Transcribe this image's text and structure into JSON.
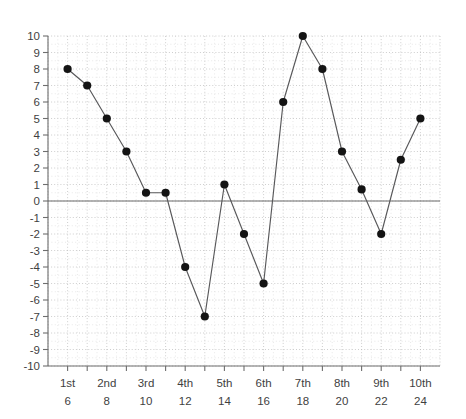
{
  "chart_data": {
    "type": "line",
    "title": "",
    "subtitle": "",
    "xlabel": "",
    "ylabel": "",
    "x": [
      6,
      7,
      8,
      9,
      10,
      11,
      12,
      13,
      14,
      15,
      16,
      17,
      18,
      19,
      20,
      21,
      22,
      23,
      24
    ],
    "values": [
      8,
      7,
      5,
      3,
      0.5,
      0.5,
      -4,
      -7,
      1,
      -2,
      -5,
      6,
      10,
      8,
      3,
      0.7,
      -2,
      2.5,
      5
    ],
    "series": [
      {
        "name": "",
        "values": [
          8,
          7,
          5,
          3,
          0.5,
          0.5,
          -4,
          -7,
          1,
          -2,
          -5,
          6,
          10,
          8,
          3,
          0.7,
          -2,
          2.5,
          5
        ]
      }
    ],
    "xlim": [
      5,
      25
    ],
    "ylim": [
      -10,
      10
    ],
    "y_ticks": [
      10,
      9,
      8,
      7,
      6,
      5,
      4,
      3,
      2,
      1,
      0,
      -1,
      -2,
      -3,
      -4,
      -5,
      -6,
      -7,
      -8,
      -9,
      -10
    ],
    "y_tick_labels": [
      "10",
      "9",
      "8",
      "7",
      "6",
      "5",
      "4",
      "3",
      "2",
      "1",
      "0",
      "-1",
      "-2",
      "-3",
      "-4",
      "-5",
      "-6",
      "-7",
      "-8",
      "-9",
      "-10"
    ],
    "x_ticks": [
      6,
      7,
      8,
      9,
      10,
      11,
      12,
      13,
      14,
      15,
      16,
      17,
      18,
      19,
      20,
      21,
      22,
      23,
      24
    ],
    "x_labeled_ticks": [
      6,
      8,
      10,
      12,
      14,
      16,
      18,
      20,
      22,
      24
    ],
    "x_tick_labels_ordinal": [
      "1st",
      "2nd",
      "3rd",
      "4th",
      "5th",
      "6th",
      "7th",
      "8th",
      "9th",
      "10th"
    ],
    "x_tick_labels_numeric": [
      "6",
      "8",
      "10",
      "12",
      "14",
      "16",
      "18",
      "20",
      "22",
      "24"
    ],
    "grid": true,
    "grid_minor": true,
    "legend": "none",
    "zero_line": true,
    "marker": "circle",
    "colors": {
      "line": "#58585a",
      "marker": "#141414",
      "axis": "#6e6e6e",
      "grid_major": "#b9b9b9",
      "grid_minor": "#d8d8d8",
      "zero_line": "#6b6b6b",
      "tick_label": "#3f3f3f",
      "background": "#ffffff"
    }
  }
}
